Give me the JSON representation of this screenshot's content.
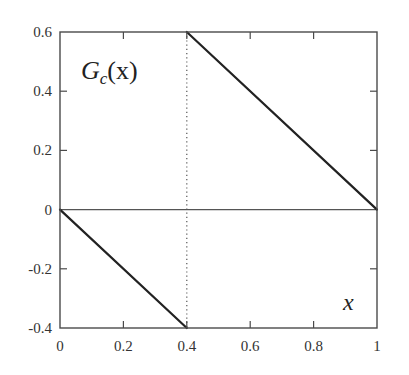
{
  "chart_data": {
    "type": "line",
    "title": "",
    "xlabel": "x",
    "ylabel": "G_c(x)",
    "annotation": {
      "function_label_main": "G",
      "function_label_sub": "c",
      "function_label_arg": "(x)",
      "x_axis_label": "x"
    },
    "xlim": [
      0,
      1
    ],
    "ylim": [
      -0.4,
      0.6
    ],
    "x_ticks": [
      0,
      0.2,
      0.4,
      0.6,
      0.8,
      1
    ],
    "x_tick_labels": [
      "0",
      "0.2",
      "0.4",
      "0.6",
      "0.8",
      "1"
    ],
    "y_ticks": [
      -0.4,
      -0.2,
      0,
      0.2,
      0.4,
      0.6
    ],
    "y_tick_labels": [
      "-0.4",
      "-0.2",
      "0",
      "0.2",
      "0.4",
      "0.6"
    ],
    "grid": false,
    "legend": null,
    "series": [
      {
        "name": "G_c(x) segment 1",
        "style": "solid",
        "x": [
          0,
          0.4
        ],
        "y": [
          0,
          -0.4
        ]
      },
      {
        "name": "G_c(x) segment 2",
        "style": "solid",
        "x": [
          0.4,
          1
        ],
        "y": [
          0.6,
          0
        ]
      }
    ],
    "reference_lines": [
      {
        "orientation": "horizontal",
        "value": 0,
        "style": "solid"
      },
      {
        "orientation": "vertical",
        "value": 0.4,
        "style": "dotted"
      }
    ],
    "discontinuity_at": 0.4,
    "colors": {
      "line": "#222222",
      "frame": "#4a4a4a",
      "zero_line": "#555555",
      "dotted_line": "#555555"
    }
  }
}
